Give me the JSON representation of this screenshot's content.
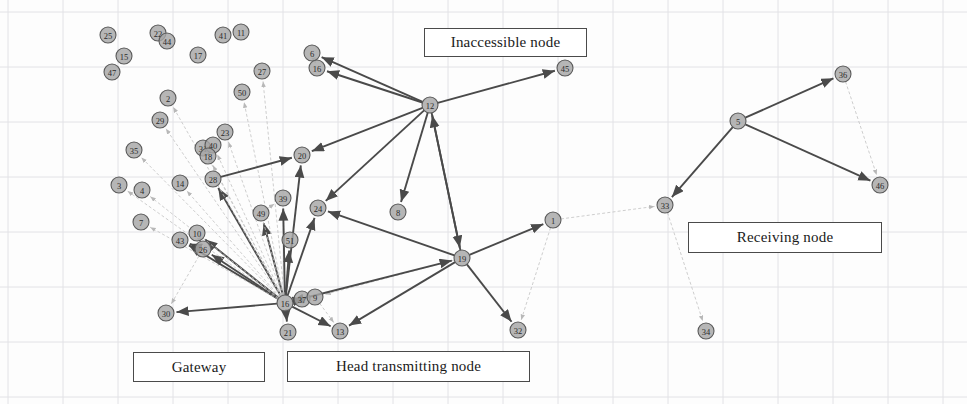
{
  "diagram": {
    "canvas": {
      "width": 967,
      "height": 404
    },
    "background": "#fdfdfd",
    "grid": {
      "visible": true,
      "spacing": 55,
      "color": "#e2e2e6"
    },
    "node": {
      "radius": 8,
      "fill": "#a6a6a6",
      "stroke": "#5a5a5a",
      "label_color": "#2b2b2b"
    },
    "edge": {
      "strong_color": "#4a4a4a",
      "weak_color": "#c2c2c2",
      "strong_width": 1.9,
      "weak_width": 0.8
    }
  },
  "legends": [
    {
      "id": "inaccessible",
      "label": "Inaccessible node"
    },
    {
      "id": "receiving",
      "label": "Receiving node"
    },
    {
      "id": "gateway",
      "label": "Gateway"
    },
    {
      "id": "head",
      "label": "Head transmitting node"
    }
  ],
  "nodes": [
    {
      "id": "25",
      "label": "25",
      "x": 108,
      "y": 35
    },
    {
      "id": "22",
      "label": "22",
      "x": 158,
      "y": 33
    },
    {
      "id": "44",
      "label": "44",
      "x": 167,
      "y": 41
    },
    {
      "id": "41",
      "label": "41",
      "x": 223,
      "y": 35
    },
    {
      "id": "11",
      "label": "11",
      "x": 241,
      "y": 32
    },
    {
      "id": "17",
      "label": "17",
      "x": 198,
      "y": 55
    },
    {
      "id": "15",
      "label": "15",
      "x": 124,
      "y": 56
    },
    {
      "id": "47",
      "label": "47",
      "x": 112,
      "y": 72
    },
    {
      "id": "27",
      "label": "27",
      "x": 262,
      "y": 71
    },
    {
      "id": "6",
      "label": "6",
      "x": 312,
      "y": 53
    },
    {
      "id": "16",
      "label": "16",
      "x": 317,
      "y": 68
    },
    {
      "id": "50",
      "label": "50",
      "x": 242,
      "y": 92
    },
    {
      "id": "2",
      "label": "2",
      "x": 168,
      "y": 98
    },
    {
      "id": "29",
      "label": "29",
      "x": 160,
      "y": 120
    },
    {
      "id": "23",
      "label": "23",
      "x": 225,
      "y": 132
    },
    {
      "id": "31",
      "label": "31",
      "x": 203,
      "y": 148
    },
    {
      "id": "40",
      "label": "40",
      "x": 213,
      "y": 145
    },
    {
      "id": "18",
      "label": "18",
      "x": 208,
      "y": 156
    },
    {
      "id": "35",
      "label": "35",
      "x": 134,
      "y": 150
    },
    {
      "id": "12",
      "label": "12",
      "x": 430,
      "y": 105
    },
    {
      "id": "45",
      "label": "45",
      "x": 565,
      "y": 68
    },
    {
      "id": "20",
      "label": "20",
      "x": 302,
      "y": 155
    },
    {
      "id": "3",
      "label": "3",
      "x": 119,
      "y": 185
    },
    {
      "id": "4",
      "label": "4",
      "x": 142,
      "y": 190
    },
    {
      "id": "14",
      "label": "14",
      "x": 180,
      "y": 183
    },
    {
      "id": "28",
      "label": "28",
      "x": 213,
      "y": 179
    },
    {
      "id": "39",
      "label": "39",
      "x": 283,
      "y": 198
    },
    {
      "id": "24",
      "label": "24",
      "x": 318,
      "y": 208
    },
    {
      "id": "8",
      "label": "8",
      "x": 398,
      "y": 212
    },
    {
      "id": "1",
      "label": "1",
      "x": 553,
      "y": 220
    },
    {
      "id": "49",
      "label": "49",
      "x": 261,
      "y": 213
    },
    {
      "id": "51",
      "label": "51",
      "x": 290,
      "y": 240
    },
    {
      "id": "7",
      "label": "7",
      "x": 141,
      "y": 222
    },
    {
      "id": "10",
      "label": "10",
      "x": 197,
      "y": 233
    },
    {
      "id": "43",
      "label": "43",
      "x": 180,
      "y": 240
    },
    {
      "id": "26",
      "label": "26",
      "x": 203,
      "y": 249
    },
    {
      "id": "19",
      "label": "19",
      "x": 462,
      "y": 258
    },
    {
      "id": "16b",
      "label": "16",
      "x": 285,
      "y": 303
    },
    {
      "id": "37",
      "label": "37",
      "x": 302,
      "y": 299
    },
    {
      "id": "9",
      "label": "9",
      "x": 315,
      "y": 297
    },
    {
      "id": "21",
      "label": "21",
      "x": 288,
      "y": 332
    },
    {
      "id": "13",
      "label": "13",
      "x": 340,
      "y": 331
    },
    {
      "id": "30",
      "label": "30",
      "x": 166,
      "y": 313
    },
    {
      "id": "32",
      "label": "32",
      "x": 518,
      "y": 330
    },
    {
      "id": "33",
      "label": "33",
      "x": 665,
      "y": 205
    },
    {
      "id": "5",
      "label": "5",
      "x": 738,
      "y": 121
    },
    {
      "id": "36",
      "label": "36",
      "x": 843,
      "y": 74
    },
    {
      "id": "46",
      "label": "46",
      "x": 880,
      "y": 185
    },
    {
      "id": "34",
      "label": "34",
      "x": 706,
      "y": 331
    }
  ],
  "edges": [
    {
      "from": "12",
      "to": "6",
      "type": "strong",
      "arrow": true
    },
    {
      "from": "12",
      "to": "16",
      "type": "strong",
      "arrow": true
    },
    {
      "from": "12",
      "to": "45",
      "type": "strong",
      "arrow": true
    },
    {
      "from": "12",
      "to": "20",
      "type": "strong",
      "arrow": true
    },
    {
      "from": "12",
      "to": "24",
      "type": "strong",
      "arrow": true
    },
    {
      "from": "12",
      "to": "8",
      "type": "strong",
      "arrow": true
    },
    {
      "from": "12",
      "to": "19",
      "type": "strong",
      "arrow": true
    },
    {
      "from": "19",
      "to": "12",
      "type": "strong",
      "arrow": true
    },
    {
      "from": "19",
      "to": "1",
      "type": "strong",
      "arrow": true
    },
    {
      "from": "19",
      "to": "32",
      "type": "strong",
      "arrow": true
    },
    {
      "from": "19",
      "to": "24",
      "type": "strong",
      "arrow": true
    },
    {
      "from": "19",
      "to": "13",
      "type": "strong",
      "arrow": true
    },
    {
      "from": "19",
      "to": "9",
      "type": "weak",
      "arrow": true
    },
    {
      "from": "16b",
      "to": "19",
      "type": "strong",
      "arrow": true
    },
    {
      "from": "16b",
      "to": "20",
      "type": "strong",
      "arrow": true
    },
    {
      "from": "16b",
      "to": "24",
      "type": "strong",
      "arrow": true
    },
    {
      "from": "16b",
      "to": "39",
      "type": "strong",
      "arrow": true
    },
    {
      "from": "16b",
      "to": "49",
      "type": "strong",
      "arrow": true
    },
    {
      "from": "16b",
      "to": "51",
      "type": "strong",
      "arrow": true
    },
    {
      "from": "16b",
      "to": "26",
      "type": "strong",
      "arrow": true
    },
    {
      "from": "16b",
      "to": "43",
      "type": "strong",
      "arrow": true
    },
    {
      "from": "16b",
      "to": "10",
      "type": "strong",
      "arrow": true
    },
    {
      "from": "16b",
      "to": "30",
      "type": "strong",
      "arrow": true
    },
    {
      "from": "16b",
      "to": "21",
      "type": "strong",
      "arrow": true
    },
    {
      "from": "16b",
      "to": "13",
      "type": "strong",
      "arrow": true
    },
    {
      "from": "16b",
      "to": "9",
      "type": "strong",
      "arrow": true
    },
    {
      "from": "16b",
      "to": "37",
      "type": "strong",
      "arrow": true
    },
    {
      "from": "16b",
      "to": "28",
      "type": "strong",
      "arrow": true
    },
    {
      "from": "16b",
      "to": "18",
      "type": "weak",
      "arrow": true
    },
    {
      "from": "16b",
      "to": "31",
      "type": "weak",
      "arrow": true
    },
    {
      "from": "16b",
      "to": "40",
      "type": "weak",
      "arrow": true
    },
    {
      "from": "16b",
      "to": "23",
      "type": "weak",
      "arrow": true
    },
    {
      "from": "16b",
      "to": "29",
      "type": "weak",
      "arrow": true
    },
    {
      "from": "16b",
      "to": "2",
      "type": "weak",
      "arrow": true
    },
    {
      "from": "16b",
      "to": "50",
      "type": "weak",
      "arrow": true
    },
    {
      "from": "16b",
      "to": "27",
      "type": "weak",
      "arrow": true
    },
    {
      "from": "16b",
      "to": "35",
      "type": "weak",
      "arrow": true
    },
    {
      "from": "16b",
      "to": "14",
      "type": "weak",
      "arrow": true
    },
    {
      "from": "16b",
      "to": "4",
      "type": "weak",
      "arrow": true
    },
    {
      "from": "16b",
      "to": "7",
      "type": "weak",
      "arrow": true
    },
    {
      "from": "16b",
      "to": "3",
      "type": "weak",
      "arrow": true
    },
    {
      "from": "16b",
      "to": "49",
      "type": "weak",
      "arrow": false
    },
    {
      "from": "26",
      "to": "43",
      "type": "strong",
      "arrow": true
    },
    {
      "from": "26",
      "to": "10",
      "type": "weak",
      "arrow": true
    },
    {
      "from": "26",
      "to": "30",
      "type": "weak",
      "arrow": true
    },
    {
      "from": "16",
      "to": "6",
      "type": "weak",
      "arrow": true
    },
    {
      "from": "1",
      "to": "33",
      "type": "weak",
      "arrow": true
    },
    {
      "from": "1",
      "to": "32",
      "type": "weak",
      "arrow": true
    },
    {
      "from": "9",
      "to": "13",
      "type": "weak",
      "arrow": true
    },
    {
      "from": "5",
      "to": "36",
      "type": "strong",
      "arrow": true
    },
    {
      "from": "5",
      "to": "46",
      "type": "strong",
      "arrow": true
    },
    {
      "from": "5",
      "to": "33",
      "type": "strong",
      "arrow": true
    },
    {
      "from": "36",
      "to": "46",
      "type": "weak",
      "arrow": true
    },
    {
      "from": "33",
      "to": "34",
      "type": "weak",
      "arrow": true
    },
    {
      "from": "49",
      "to": "39",
      "type": "weak",
      "arrow": true
    },
    {
      "from": "28",
      "to": "20",
      "type": "strong",
      "arrow": true
    }
  ]
}
